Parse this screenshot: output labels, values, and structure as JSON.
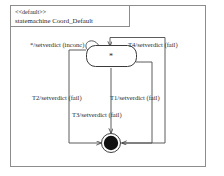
{
  "diagram": {
    "kind": "uml-statechart",
    "stereotype": "<<default>>",
    "title": "statemachine Coord_Default",
    "frame": {
      "border_color": "#8d8d8d",
      "background": "#ffffff"
    },
    "states": [
      {
        "id": "composite-state",
        "type": "state",
        "label": "*",
        "shape": "rounded-rect"
      },
      {
        "id": "final-state",
        "type": "final",
        "label": "",
        "shape": "filled-circle"
      }
    ],
    "transitions": [
      {
        "id": "t-self",
        "label": "*/setverdict (inconc)",
        "from": "composite-state",
        "to": "composite-state",
        "routing": "self-loop"
      },
      {
        "id": "t4",
        "label": "T4/setverdict (fail)",
        "from": "final-state",
        "to": "composite-state",
        "routing": "outer-right"
      },
      {
        "id": "t2",
        "label": "T2/setverdict (fail)",
        "from": "composite-state",
        "to": "final-state",
        "routing": "left"
      },
      {
        "id": "t1",
        "label": "T1/setverdict (fail)",
        "from": "composite-state",
        "to": "final-state",
        "routing": "inner-right"
      },
      {
        "id": "t3",
        "label": "T3/setverdict (fail)",
        "from": "composite-state",
        "to": "final-state",
        "routing": "center"
      }
    ],
    "colors": {
      "line": "#4a4a4a",
      "frame": "#8d8d8d",
      "text": "#2b2b2b",
      "final_fill": "#111111"
    }
  }
}
